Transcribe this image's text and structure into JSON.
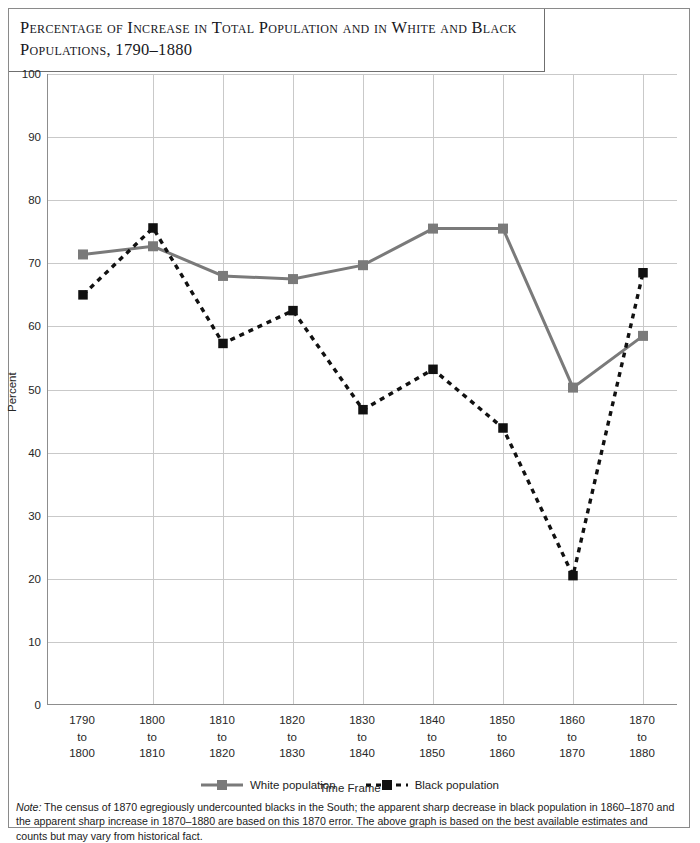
{
  "title": "Percentage of Increase in Total Population and in White and Black Populations, 1790–1880",
  "note_label": "Note:",
  "note_text": " The census of 1870 egregiously undercounted blacks in the South; the apparent sharp decrease in black population in 1860–1870 and the apparent sharp increase in 1870–1880 are based on this 1870 error. The above graph is based on the best available estimates and counts but may vary from historical fact.",
  "colors": {
    "white_series": "#7a7a7a",
    "black_series": "#111111",
    "gridline": "#c9c9c9",
    "axis": "#8d8d8d",
    "frame": "#8a8a8a",
    "text": "#262626"
  },
  "chart_data": {
    "type": "line",
    "title": "Percentage of Increase in Total Population and in White and Black Populations, 1790–1880",
    "xlabel": "Time Frame",
    "ylabel": "Percent",
    "ylim": [
      0,
      100
    ],
    "yticks": [
      0,
      10,
      20,
      30,
      40,
      50,
      60,
      70,
      80,
      90,
      100
    ],
    "grid": true,
    "legend_position": "bottom",
    "categories": [
      "1790\nto\n1800",
      "1800\nto\n1810",
      "1810\nto\n1820",
      "1820\nto\n1830",
      "1830\nto\n1840",
      "1840\nto\n1850",
      "1850\nto\n1860",
      "1860\nto\n1870",
      "1870\nto\n1880"
    ],
    "category_parts": [
      [
        "1790",
        "to",
        "1800"
      ],
      [
        "1800",
        "to",
        "1810"
      ],
      [
        "1810",
        "to",
        "1820"
      ],
      [
        "1820",
        "to",
        "1830"
      ],
      [
        "1830",
        "to",
        "1840"
      ],
      [
        "1840",
        "to",
        "1850"
      ],
      [
        "1850",
        "to",
        "1860"
      ],
      [
        "1860",
        "to",
        "1870"
      ],
      [
        "1870",
        "to",
        "1880"
      ]
    ],
    "series": [
      {
        "name": "White population",
        "style": "solid",
        "color": "#7a7a7a",
        "marker": "square",
        "values": [
          71.4,
          72.7,
          68.0,
          67.5,
          69.7,
          75.5,
          75.5,
          50.3,
          58.5
        ]
      },
      {
        "name": "Black population",
        "style": "dashed",
        "color": "#111111",
        "marker": "square",
        "values": [
          65.0,
          75.6,
          57.3,
          62.5,
          46.8,
          53.2,
          43.9,
          20.5,
          68.5
        ]
      }
    ]
  }
}
